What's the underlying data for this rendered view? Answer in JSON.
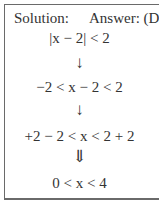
{
  "header": {
    "solution_label": "Solution:",
    "answer_label": "Answer: (D)"
  },
  "steps": [
    {
      "type": "expr",
      "text": "|x − 2| < 2"
    },
    {
      "type": "arrow",
      "icon": "down-arrow-icon",
      "glyph": "↓"
    },
    {
      "type": "expr",
      "text": "−2 < x − 2 < 2"
    },
    {
      "type": "arrow",
      "icon": "down-arrow-icon",
      "glyph": "↓"
    },
    {
      "type": "expr",
      "text": "+2 − 2 < x < 2 + 2"
    },
    {
      "type": "arrow",
      "icon": "double-down-arrow-icon",
      "glyph": "⇓"
    },
    {
      "type": "expr",
      "text": "0 < x < 4"
    }
  ]
}
